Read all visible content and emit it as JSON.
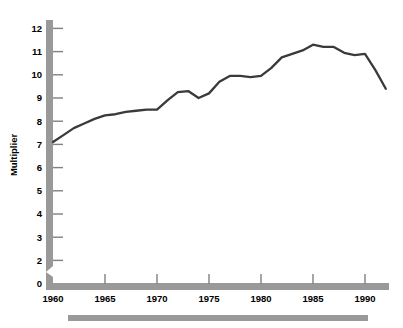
{
  "chart_data": {
    "type": "line",
    "title": "",
    "subtitle": "",
    "xlabel": "",
    "ylabel": "Multiplier",
    "x": [
      1960,
      1961,
      1962,
      1963,
      1964,
      1965,
      1966,
      1967,
      1968,
      1969,
      1970,
      1971,
      1972,
      1973,
      1974,
      1975,
      1976,
      1977,
      1978,
      1979,
      1980,
      1981,
      1982,
      1983,
      1984,
      1985,
      1986,
      1987,
      1988,
      1989,
      1990,
      1991,
      1992
    ],
    "values": [
      7.1,
      7.4,
      7.7,
      7.9,
      8.1,
      8.25,
      8.3,
      8.4,
      8.45,
      8.5,
      8.5,
      8.9,
      9.25,
      9.3,
      9.0,
      9.2,
      9.7,
      9.95,
      9.95,
      9.9,
      9.95,
      10.3,
      10.75,
      10.9,
      11.05,
      11.3,
      11.2,
      11.2,
      10.95,
      10.85,
      10.9,
      10.2,
      9.4
    ],
    "series": [
      {
        "name": "Multiplier",
        "values": [
          7.1,
          7.4,
          7.7,
          7.9,
          8.1,
          8.25,
          8.3,
          8.4,
          8.45,
          8.5,
          8.5,
          8.9,
          9.25,
          9.3,
          9.0,
          9.2,
          9.7,
          9.95,
          9.95,
          9.9,
          9.95,
          10.3,
          10.75,
          10.9,
          11.05,
          11.3,
          11.2,
          11.2,
          10.95,
          10.85,
          10.9,
          10.2,
          9.4
        ],
        "color": "#3a3a3a"
      }
    ],
    "xticks": [
      1960,
      1965,
      1970,
      1975,
      1980,
      1985,
      1990
    ],
    "xticklabels": [
      "1960",
      "1965",
      "1970",
      "1975",
      "1980",
      "1985",
      "1990"
    ],
    "yticks": [
      0,
      2,
      3,
      4,
      5,
      6,
      7,
      8,
      9,
      10,
      11,
      12
    ],
    "yticklabels": [
      "0",
      "2",
      "3",
      "4",
      "5",
      "6",
      "7",
      "8",
      "9",
      "10",
      "11",
      "12"
    ],
    "ylim": [
      0,
      12.4
    ],
    "xlim": [
      1960,
      1992.5
    ],
    "axis_break": true,
    "axis_break_between": [
      0,
      2
    ],
    "grid": false,
    "legend": false,
    "legend_position": "none",
    "annotations": []
  },
  "colors": {
    "line": "#3a3a3a",
    "axis_bar": "#999999",
    "tick_mark": "#808080",
    "footer_bar": "#999999",
    "background": "#ffffff",
    "text": "#000000"
  },
  "axes": {
    "y_axis_title": "Multiplier"
  }
}
